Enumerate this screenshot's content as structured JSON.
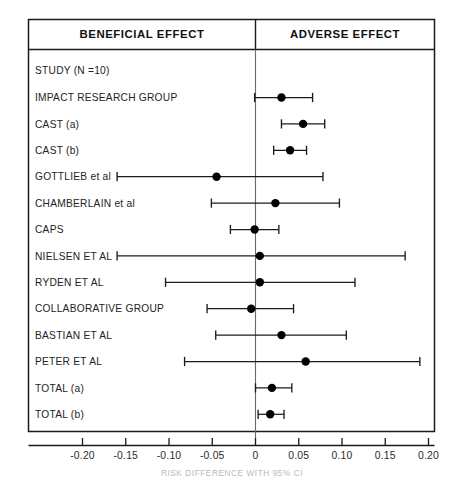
{
  "figure": {
    "header_left": "BENEFICIAL EFFECT",
    "header_right": "ADVERSE EFFECT",
    "caption": "RISK DIFFERENCE WITH 95% CI"
  },
  "chart_data": {
    "type": "scatter",
    "plot_kind": "forest-plot",
    "title": "",
    "xlabel": "RISK DIFFERENCE WITH 95% CI",
    "ylabel": "",
    "xlim": [
      -0.225,
      0.225
    ],
    "grid": false,
    "legend": "none",
    "reference_line": 0,
    "xticks": [
      -0.2,
      -0.15,
      -0.1,
      -0.05,
      0,
      0.05,
      0.1,
      0.15,
      0.2
    ],
    "xtick_labels": [
      "-0.20",
      "-0.15",
      "-0.10",
      "-0.05",
      "0",
      "0.05",
      "0.10",
      "0.15",
      "0.20"
    ],
    "column_headers": [
      "BENEFICIAL EFFECT",
      "ADVERSE EFFECT"
    ],
    "row_header": "STUDY (N =10)",
    "categories": [
      "IMPACT RESEARCH GROUP",
      "CAST (a)",
      "CAST (b)",
      "GOTTLIEB et al",
      "CHAMBERLAIN et al",
      "CAPS",
      "NIELSEN ET AL",
      "RYDEN ET AL",
      "COLLABORATIVE GROUP",
      "BASTIAN ET AL",
      "PETER ET AL",
      "TOTAL (a)",
      "TOTAL (b)"
    ],
    "series": [
      {
        "name": "Risk difference (point estimate)",
        "values": [
          0.03,
          0.055,
          0.04,
          -0.045,
          0.023,
          -0.001,
          0.005,
          0.005,
          -0.005,
          0.03,
          0.058,
          0.019,
          0.017
        ]
      },
      {
        "name": "95% CI lower",
        "values": [
          -0.001,
          0.03,
          0.021,
          -0.16,
          -0.051,
          -0.029,
          -0.16,
          -0.104,
          -0.056,
          -0.046,
          -0.082,
          0.0,
          0.003
        ]
      },
      {
        "name": "95% CI upper",
        "values": [
          0.066,
          0.08,
          0.059,
          0.078,
          0.097,
          0.027,
          0.173,
          0.115,
          0.044,
          0.105,
          0.19,
          0.042,
          0.033
        ]
      }
    ],
    "rows": [
      {
        "label": "IMPACT RESEARCH GROUP",
        "estimate": 0.03,
        "ci_low": -0.001,
        "ci_high": 0.066
      },
      {
        "label": "CAST (a)",
        "estimate": 0.055,
        "ci_low": 0.03,
        "ci_high": 0.08
      },
      {
        "label": "CAST (b)",
        "estimate": 0.04,
        "ci_low": 0.021,
        "ci_high": 0.059
      },
      {
        "label": "GOTTLIEB et al",
        "estimate": -0.045,
        "ci_low": -0.16,
        "ci_high": 0.078
      },
      {
        "label": "CHAMBERLAIN et al",
        "estimate": 0.023,
        "ci_low": -0.051,
        "ci_high": 0.097
      },
      {
        "label": "CAPS",
        "estimate": -0.001,
        "ci_low": -0.029,
        "ci_high": 0.027
      },
      {
        "label": "NIELSEN ET AL",
        "estimate": 0.005,
        "ci_low": -0.16,
        "ci_high": 0.173
      },
      {
        "label": "RYDEN ET AL",
        "estimate": 0.005,
        "ci_low": -0.104,
        "ci_high": 0.115
      },
      {
        "label": "COLLABORATIVE GROUP",
        "estimate": -0.005,
        "ci_low": -0.056,
        "ci_high": 0.044
      },
      {
        "label": "BASTIAN ET AL",
        "estimate": 0.03,
        "ci_low": -0.046,
        "ci_high": 0.105
      },
      {
        "label": "PETER ET AL",
        "estimate": 0.058,
        "ci_low": -0.082,
        "ci_high": 0.19
      },
      {
        "label": "TOTAL (a)",
        "estimate": 0.019,
        "ci_low": 0.0,
        "ci_high": 0.042
      },
      {
        "label": "TOTAL (b)",
        "estimate": 0.017,
        "ci_low": 0.003,
        "ci_high": 0.033
      }
    ]
  }
}
